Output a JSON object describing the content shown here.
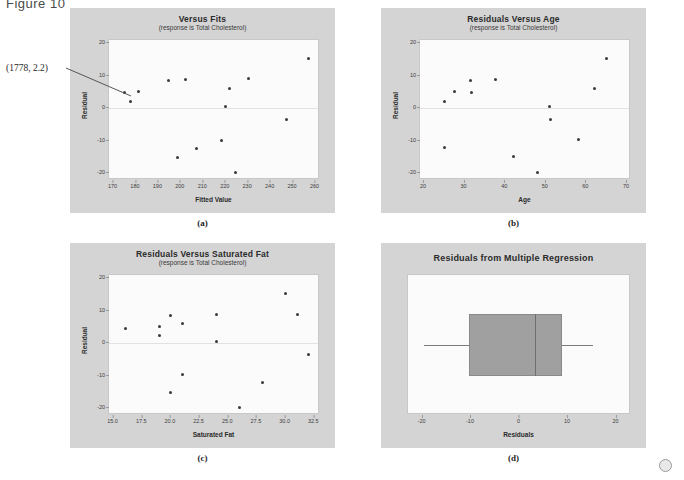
{
  "figure": {
    "label": "Figure 10"
  },
  "corner_marker": {
    "name": "circle-marker"
  },
  "panels": [
    {
      "key": "a",
      "caption": "(a)",
      "annotation": {
        "text": "(1778, 2.2)"
      },
      "chart_data": {
        "type": "scatter",
        "title": "Versus Fits",
        "subtitle": "(response is Total Cholesterol)",
        "xlabel": "Fitted Value",
        "ylabel": "Residual",
        "xlim": [
          168,
          262
        ],
        "ylim": [
          -22,
          21
        ],
        "xticks": [
          170,
          180,
          190,
          200,
          210,
          220,
          230,
          240,
          250,
          260
        ],
        "yticks": [
          20,
          10,
          0,
          -10,
          -20
        ],
        "grid": false,
        "zero_reference_line": 0,
        "points": [
          {
            "x": 175.0,
            "y": 4.8
          },
          {
            "x": 177.8,
            "y": 2.2
          },
          {
            "x": 181.0,
            "y": 5.2
          },
          {
            "x": 194.5,
            "y": 8.6
          },
          {
            "x": 198.5,
            "y": -15.1
          },
          {
            "x": 202.0,
            "y": 8.8
          },
          {
            "x": 207.0,
            "y": -12.2
          },
          {
            "x": 218.0,
            "y": -9.8
          },
          {
            "x": 220.0,
            "y": 0.6
          },
          {
            "x": 221.5,
            "y": 6.1
          },
          {
            "x": 224.5,
            "y": -19.8
          },
          {
            "x": 230.0,
            "y": 9.1
          },
          {
            "x": 247.0,
            "y": -3.5
          },
          {
            "x": 257.0,
            "y": 15.2
          }
        ]
      }
    },
    {
      "key": "b",
      "caption": "(b)",
      "chart_data": {
        "type": "scatter",
        "title": "Residuals Versus Age",
        "subtitle": "(response is Total Cholesterol)",
        "xlabel": "Age",
        "ylabel": "Residual",
        "xlim": [
          19,
          71
        ],
        "ylim": [
          -22,
          21
        ],
        "xticks": [
          20,
          30,
          40,
          50,
          60,
          70
        ],
        "yticks": [
          20,
          10,
          0,
          -10,
          -20
        ],
        "grid": false,
        "zero_reference_line": 0,
        "points": [
          {
            "x": 25.0,
            "y": 2.2
          },
          {
            "x": 25.0,
            "y": -12.0
          },
          {
            "x": 27.5,
            "y": 5.1
          },
          {
            "x": 31.5,
            "y": 8.7
          },
          {
            "x": 31.8,
            "y": 4.9
          },
          {
            "x": 37.5,
            "y": 9.0
          },
          {
            "x": 42.0,
            "y": -14.9
          },
          {
            "x": 48.0,
            "y": -19.8
          },
          {
            "x": 51.0,
            "y": 0.7
          },
          {
            "x": 51.2,
            "y": -3.5
          },
          {
            "x": 58.0,
            "y": -9.7
          },
          {
            "x": 62.0,
            "y": 6.1
          },
          {
            "x": 65.0,
            "y": 15.2
          }
        ]
      }
    },
    {
      "key": "c",
      "caption": "(c)",
      "chart_data": {
        "type": "scatter",
        "title": "Residuals Versus Saturated Fat",
        "subtitle": "(response is Total Cholesterol)",
        "xlabel": "Saturated Fat",
        "ylabel": "Residual",
        "xlim": [
          14.6,
          33.0
        ],
        "ylim": [
          -22,
          21
        ],
        "xticks": [
          15.0,
          17.5,
          20.0,
          22.5,
          25.0,
          27.5,
          30.0,
          32.5
        ],
        "yticks": [
          20,
          10,
          0,
          -10,
          -20
        ],
        "grid": false,
        "zero_reference_line": 0,
        "points": [
          {
            "x": 16.0,
            "y": 4.7
          },
          {
            "x": 19.0,
            "y": 5.2
          },
          {
            "x": 19.0,
            "y": 2.3
          },
          {
            "x": 20.0,
            "y": 8.7
          },
          {
            "x": 20.0,
            "y": -15.0
          },
          {
            "x": 21.0,
            "y": 6.0
          },
          {
            "x": 21.0,
            "y": -9.7
          },
          {
            "x": 24.0,
            "y": 8.8
          },
          {
            "x": 24.0,
            "y": 0.6
          },
          {
            "x": 26.0,
            "y": -19.8
          },
          {
            "x": 28.0,
            "y": -12.1
          },
          {
            "x": 30.0,
            "y": 15.2
          },
          {
            "x": 31.0,
            "y": 9.0
          },
          {
            "x": 32.0,
            "y": -3.4
          }
        ]
      }
    },
    {
      "key": "d",
      "caption": "(d)",
      "chart_data": {
        "type": "boxplot",
        "title": "Residuals from Multiple Regression",
        "subtitle": "",
        "xlabel": "Residuals",
        "ylabel": "",
        "xlim": [
          -23,
          23
        ],
        "xticks": [
          -20,
          -10,
          0,
          10,
          20
        ],
        "grid": false,
        "box": {
          "whisker_low": -19.8,
          "q1": -10.5,
          "median": 3.2,
          "q3": 8.8,
          "whisker_high": 15.2
        }
      }
    }
  ]
}
